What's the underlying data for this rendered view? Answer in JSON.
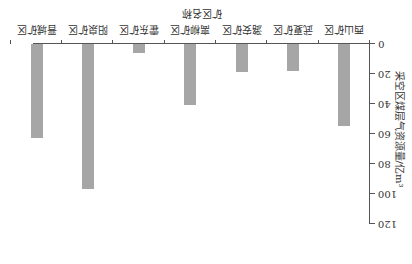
{
  "image_orientation": "rotated-180",
  "chart_data": {
    "type": "bar",
    "title": "",
    "xlabel": "矿区名称",
    "ylabel": "采空区煤层气资源量/亿m³",
    "categories": [
      "西山矿区",
      "武夏矿区",
      "潞安矿区",
      "离柳矿区",
      "霍东矿区",
      "阳泉矿区",
      "晋城矿区"
    ],
    "values": [
      55,
      18,
      19,
      40.5,
      6,
      96.5,
      63
    ],
    "ylim": [
      0,
      120
    ],
    "yticks": [
      "0",
      "20",
      "40",
      "60",
      "80",
      "100",
      "120"
    ],
    "grid": false,
    "legend": "none",
    "bar_color": "#a6a6a6"
  }
}
